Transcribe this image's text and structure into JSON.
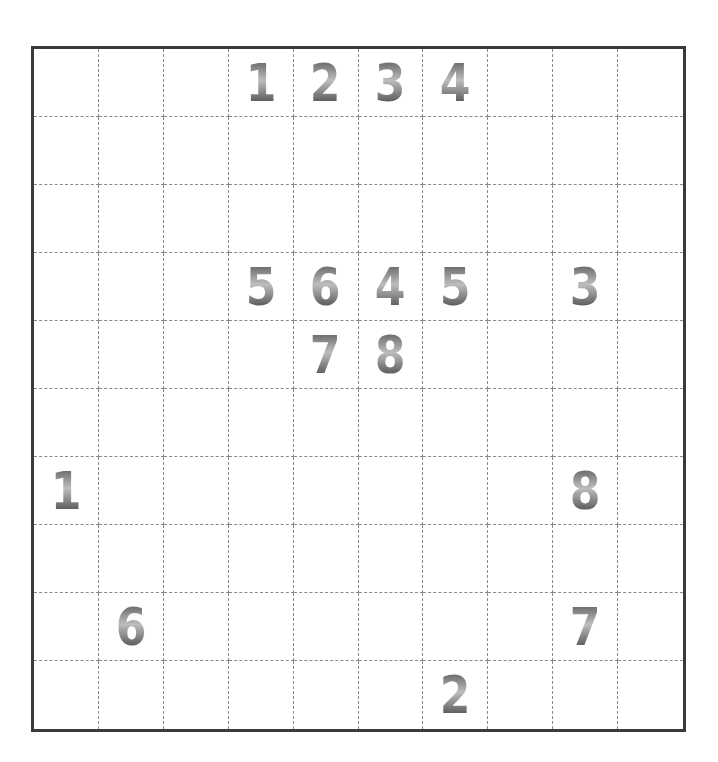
{
  "puzzle": {
    "rows": 10,
    "cols": 10,
    "colors": {
      "border": "#3a3a3a",
      "gridline": "#8a8a8a",
      "digit_dark": "#3c3c3c",
      "digit_light": "#bdbdbd",
      "background": "#ffffff"
    },
    "clues": [
      {
        "row": 0,
        "col": 3,
        "value": "1"
      },
      {
        "row": 0,
        "col": 4,
        "value": "2"
      },
      {
        "row": 0,
        "col": 5,
        "value": "3"
      },
      {
        "row": 0,
        "col": 6,
        "value": "4"
      },
      {
        "row": 3,
        "col": 3,
        "value": "5"
      },
      {
        "row": 3,
        "col": 4,
        "value": "6"
      },
      {
        "row": 3,
        "col": 5,
        "value": "4"
      },
      {
        "row": 3,
        "col": 6,
        "value": "5"
      },
      {
        "row": 3,
        "col": 8,
        "value": "3"
      },
      {
        "row": 4,
        "col": 4,
        "value": "7"
      },
      {
        "row": 4,
        "col": 5,
        "value": "8"
      },
      {
        "row": 6,
        "col": 0,
        "value": "1"
      },
      {
        "row": 6,
        "col": 8,
        "value": "8"
      },
      {
        "row": 8,
        "col": 1,
        "value": "6"
      },
      {
        "row": 8,
        "col": 8,
        "value": "7"
      },
      {
        "row": 9,
        "col": 6,
        "value": "2"
      }
    ]
  }
}
